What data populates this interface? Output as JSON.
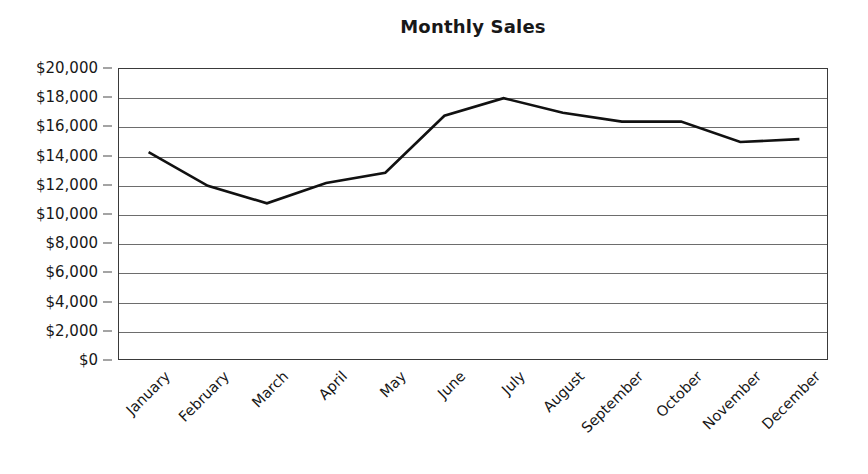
{
  "chart_data": {
    "type": "line",
    "title": "Monthly Sales",
    "xlabel": "",
    "ylabel": "",
    "categories": [
      "January",
      "February",
      "March",
      "April",
      "May",
      "June",
      "July",
      "August",
      "September",
      "October",
      "November",
      "December"
    ],
    "values": [
      14300,
      12000,
      10800,
      12200,
      12900,
      16800,
      18000,
      17000,
      16400,
      16400,
      15000,
      15200
    ],
    "series": [
      {
        "name": "Monthly Sales",
        "values": [
          14300,
          12000,
          10800,
          12200,
          12900,
          16800,
          18000,
          17000,
          16400,
          16400,
          15000,
          15200
        ]
      }
    ],
    "ylim": [
      0,
      20000
    ],
    "ytick_step": 2000,
    "ytick_labels": [
      "$20,000",
      "$18,000",
      "$16,000",
      "$14,000",
      "$12,000",
      "$10,000",
      "$8,000",
      "$6,000",
      "$4,000",
      "$2,000",
      "$0"
    ],
    "ytick_values": [
      20000,
      18000,
      16000,
      14000,
      12000,
      10000,
      8000,
      6000,
      4000,
      2000,
      0
    ],
    "grid": true,
    "legend": false,
    "markers": false,
    "xtick_rotation": -45,
    "colors": {
      "line": "#111111",
      "gridline": "#6d6d6d",
      "axis": "#3a3a3a",
      "text": "#171717",
      "background": "#ffffff"
    }
  }
}
